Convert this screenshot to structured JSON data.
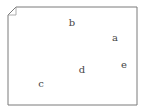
{
  "diagram": {
    "shape": "page-with-folded-corner",
    "stroke_color": "#7a7a7a",
    "points": [
      {
        "label": "b",
        "x": 72,
        "y": 23
      },
      {
        "label": "a",
        "x": 115,
        "y": 38
      },
      {
        "label": "e",
        "x": 124,
        "y": 65
      },
      {
        "label": "d",
        "x": 82,
        "y": 70
      },
      {
        "label": "c",
        "x": 41,
        "y": 84
      }
    ]
  }
}
